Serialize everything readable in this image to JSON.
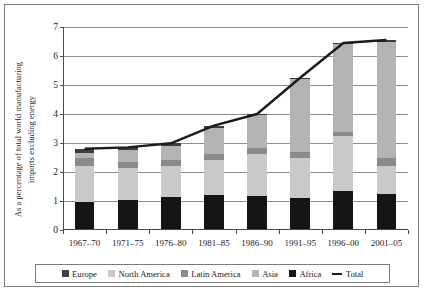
{
  "chart_data": {
    "type": "bar",
    "subtype": "stacked-bar-with-line",
    "title": "",
    "xlabel": "",
    "ylabel": "As a percentage of total world manufacturing imports excluding energy",
    "ylabel_lines": [
      "As a percentage of total world manufacturing",
      "imports excluding energy"
    ],
    "ylim": [
      0,
      7
    ],
    "yticks": [
      0,
      1,
      2,
      3,
      4,
      5,
      6,
      7
    ],
    "ytick_labels": [
      "0",
      "1",
      "2",
      "3",
      "4",
      "5",
      "6",
      "7"
    ],
    "grid": true,
    "legend_position": "bottom",
    "categories": [
      "1967–70",
      "1971–75",
      "1976–80",
      "1981–85",
      "1986–90",
      "1991–95",
      "1996–00",
      "2001–05"
    ],
    "series": [
      {
        "name": "Africa",
        "color": "#151515",
        "values": [
          0.98,
          1.05,
          1.13,
          1.21,
          1.18,
          1.12,
          1.35,
          1.25
        ]
      },
      {
        "name": "North America",
        "color": "#c9c9c9",
        "values": [
          1.22,
          1.08,
          1.07,
          1.21,
          1.43,
          1.35,
          1.88,
          0.95
        ]
      },
      {
        "name": "Latin America",
        "color": "#8a8a8a",
        "values": [
          0.27,
          0.22,
          0.21,
          0.2,
          0.22,
          0.22,
          0.15,
          0.28
        ]
      },
      {
        "name": "Asia",
        "color": "#b3b3b3",
        "values": [
          0.18,
          0.4,
          0.48,
          0.9,
          1.12,
          2.52,
          3.02,
          4.02
        ]
      },
      {
        "name": "Europe",
        "color": "#3d3d3d",
        "values": [
          0.15,
          0.1,
          0.1,
          0.08,
          0.05,
          0.04,
          0.05,
          0.05
        ]
      }
    ],
    "totals": [
      2.8,
      2.85,
      2.99,
      3.6,
      4.0,
      5.25,
      6.45,
      6.55
    ],
    "total_line": {
      "name": "Total",
      "color": "#1c1c1c",
      "values": [
        2.8,
        2.85,
        2.99,
        3.6,
        4.0,
        5.25,
        6.45,
        6.55
      ]
    }
  },
  "legend": {
    "items": [
      {
        "label": "Europe",
        "swatch": "#3d3d3d",
        "kind": "swatch"
      },
      {
        "label": "North America",
        "swatch": "#c9c9c9",
        "kind": "swatch"
      },
      {
        "label": "Latin America",
        "swatch": "#8a8a8a",
        "kind": "swatch"
      },
      {
        "label": "Asia",
        "swatch": "#b3b3b3",
        "kind": "swatch"
      },
      {
        "label": "Africa",
        "swatch": "#151515",
        "kind": "swatch"
      },
      {
        "label": "Total",
        "swatch": "#1c1c1c",
        "kind": "line"
      }
    ]
  },
  "colors": {
    "frame": "#7a7a7a",
    "axis": "#4a4a4a",
    "grid": "#8d8d8d",
    "background": "#ffffff"
  }
}
